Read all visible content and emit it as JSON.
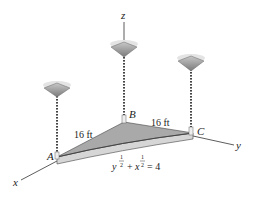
{
  "diagram": {
    "axes": {
      "x_label": "x",
      "y_label": "y",
      "z_label": "z"
    },
    "points": {
      "A": "A",
      "B": "B",
      "C": "C"
    },
    "dimensions": {
      "AB": "16 ft",
      "BC": "16 ft"
    },
    "equation": {
      "y_base": "y",
      "x_base": "x",
      "exp_num": "1",
      "exp_den": "2",
      "plus": "+",
      "rhs": "= 4"
    },
    "colors": {
      "plate_top": "#a8a8a8",
      "plate_edge": "#d4d4d4",
      "rod": "#555555",
      "canopy": "#8f8f8f",
      "axis": "#333333"
    }
  }
}
